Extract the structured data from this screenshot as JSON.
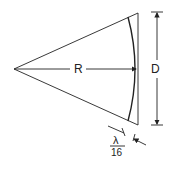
{
  "diagram": {
    "type": "antenna-sector-geometry",
    "labels": {
      "radius": "R",
      "aperture": "D",
      "tolerance_numerator": "λ",
      "tolerance_denominator": "16"
    },
    "colors": {
      "line": "#222222",
      "background": "#ffffff"
    }
  }
}
